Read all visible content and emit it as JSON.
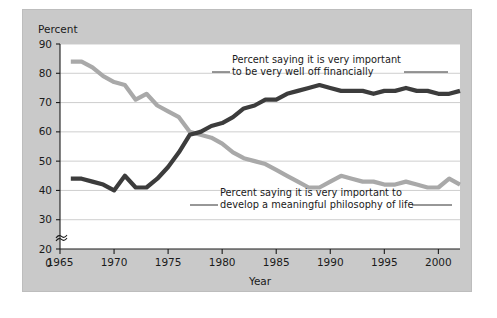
{
  "figure": {
    "background": "#ffffff",
    "panel_color": "#c9c9c9",
    "plot_color": "#ffffff"
  },
  "axes": {
    "y_unit_label": "Percent",
    "x_axis_title": "Year",
    "y_ticks": [
      "0",
      "20",
      "30",
      "40",
      "50",
      "60",
      "70",
      "80",
      "90"
    ],
    "x_ticks": [
      "1965",
      "1970",
      "1975",
      "1980",
      "1985",
      "1990",
      "1995",
      "2000"
    ],
    "y_axis_break": "axis-break-symbol"
  },
  "annotations": {
    "dark_line_1": "Percent saying it is very important",
    "dark_line_2": "to be very well off financially",
    "gray_line_1": "Percent saying it is very important to",
    "gray_line_2": "develop a meaningful philosophy of life"
  },
  "chart_data": {
    "type": "line",
    "title": "",
    "xlabel": "Year",
    "ylabel": "Percent",
    "xlim": [
      1965,
      2002
    ],
    "ylim": [
      20,
      90
    ],
    "y_axis_break_below": 20,
    "grid": true,
    "grid_axis": "y",
    "legend": "inline-annotations",
    "x": [
      1966,
      1967,
      1968,
      1969,
      1970,
      1971,
      1972,
      1973,
      1974,
      1975,
      1976,
      1977,
      1978,
      1979,
      1980,
      1981,
      1982,
      1983,
      1984,
      1985,
      1986,
      1987,
      1988,
      1989,
      1990,
      1991,
      1992,
      1993,
      1994,
      1995,
      1996,
      1997,
      1998,
      1999,
      2000,
      2001,
      2002
    ],
    "series": [
      {
        "name": "Percent saying it is very important to be very well off financially",
        "color": "#3c3c3c",
        "values": [
          44,
          44,
          43,
          42,
          40,
          45,
          41,
          41,
          44,
          48,
          53,
          59,
          60,
          62,
          63,
          65,
          68,
          69,
          71,
          71,
          73,
          74,
          75,
          76,
          75,
          74,
          74,
          74,
          73,
          74,
          74,
          75,
          74,
          74,
          73,
          73,
          74
        ]
      },
      {
        "name": "Percent saying it is very important to develop a meaningful philosophy of life",
        "color": "#a9a9a9",
        "values": [
          84,
          84,
          82,
          79,
          77,
          76,
          71,
          73,
          69,
          67,
          65,
          60,
          59,
          58,
          56,
          53,
          51,
          50,
          49,
          47,
          45,
          43,
          41,
          41,
          43,
          45,
          44,
          43,
          43,
          42,
          42,
          43,
          42,
          41,
          41,
          44,
          42
        ]
      }
    ]
  }
}
